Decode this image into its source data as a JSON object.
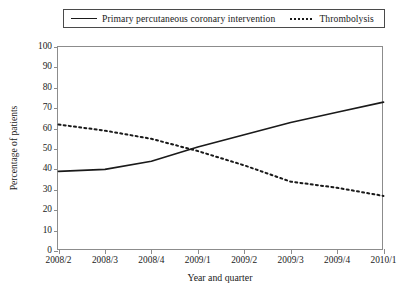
{
  "chart_data": {
    "type": "line",
    "title": "",
    "subtitle": "",
    "xlabel": "Year and quarter",
    "ylabel": "Percentage of patients",
    "categories": [
      "2008/2",
      "2008/3",
      "2008/4",
      "2009/1",
      "2009/2",
      "2009/3",
      "2009/4",
      "2010/1"
    ],
    "ylim": [
      0,
      100
    ],
    "yticks": [
      0,
      10,
      20,
      30,
      40,
      50,
      60,
      70,
      80,
      90,
      100
    ],
    "ytick_labels": [
      "0",
      "10",
      "20",
      "30",
      "40",
      "50",
      "60",
      "70",
      "80",
      "90",
      "100"
    ],
    "grid": false,
    "legend_position": "top",
    "series": [
      {
        "name": "Primary percutaneous coronary intervention",
        "style": "solid",
        "color": "#1a1a1a",
        "values": [
          39,
          40,
          44,
          51,
          57,
          63,
          68,
          73
        ]
      },
      {
        "name": "Thrombolysis",
        "style": "dotted",
        "color": "#1a1a1a",
        "values": [
          62,
          59,
          55,
          49,
          42,
          34,
          31,
          27
        ]
      }
    ],
    "annotations": []
  },
  "legend": {
    "entries": [
      {
        "label": "Primary percutaneous coronary intervention",
        "marker": "solid-line-icon"
      },
      {
        "label": "Thrombolysis",
        "marker": "dotted-line-icon"
      }
    ]
  },
  "colors": {
    "axis": "#8c8c8c",
    "text": "#1a1a1a",
    "series": "#1a1a1a",
    "background": "#ffffff"
  }
}
